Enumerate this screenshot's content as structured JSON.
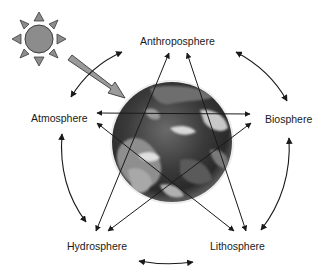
{
  "diagram": {
    "nodes": [
      {
        "id": "anthroposphere",
        "label": "Anthroposphere"
      },
      {
        "id": "atmosphere",
        "label": "Atmosphere"
      },
      {
        "id": "biosphere",
        "label": "Biosphere"
      },
      {
        "id": "hydrosphere",
        "label": "Hydrosphere"
      },
      {
        "id": "lithosphere",
        "label": "Lithosphere"
      }
    ],
    "center_image": "earth-globe",
    "energy_source": "sun",
    "edges": [
      {
        "from": "atmosphere",
        "to": "anthroposphere",
        "style": "curved",
        "bidirectional": true
      },
      {
        "from": "anthroposphere",
        "to": "biosphere",
        "style": "curved",
        "bidirectional": true
      },
      {
        "from": "biosphere",
        "to": "lithosphere",
        "style": "curved",
        "bidirectional": true
      },
      {
        "from": "lithosphere",
        "to": "hydrosphere",
        "style": "curved",
        "bidirectional": true
      },
      {
        "from": "hydrosphere",
        "to": "atmosphere",
        "style": "curved",
        "bidirectional": true
      },
      {
        "from": "atmosphere",
        "to": "biosphere",
        "style": "straight",
        "bidirectional": true
      },
      {
        "from": "atmosphere",
        "to": "lithosphere",
        "style": "straight",
        "bidirectional": true
      },
      {
        "from": "biosphere",
        "to": "hydrosphere",
        "style": "straight",
        "bidirectional": true
      },
      {
        "from": "anthroposphere",
        "to": "hydrosphere",
        "style": "straight",
        "bidirectional": true
      },
      {
        "from": "anthroposphere",
        "to": "lithosphere",
        "style": "straight",
        "bidirectional": true
      },
      {
        "from": "sun",
        "to": "earth",
        "style": "block-arrow",
        "bidirectional": false
      }
    ],
    "colors": {
      "sun_fill": "#8c8c8c",
      "sun_outline": "#3c3c3c",
      "arrow_stroke": "#1a1a1a",
      "sun_arrow_fill": "#9a9a9a",
      "globe_dark": "#2a2a2a",
      "globe_light": "#bdbdbd"
    }
  }
}
